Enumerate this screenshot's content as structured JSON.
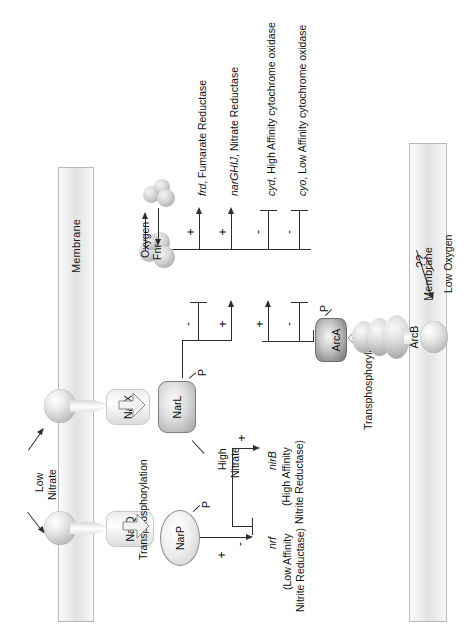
{
  "diagram": {
    "membrane_left_label": "Membrane",
    "membrane_right_label": "Membrane"
  },
  "left_system": {
    "stimulus_label": "Low\nNitrate",
    "stimulus_line1": "Low",
    "stimulus_line2": "Nitrate",
    "sensors": [
      {
        "name": "NarX"
      },
      {
        "name": "NarQ"
      }
    ],
    "transfer_label": "Transphosphorylation",
    "regulators": [
      {
        "name": "NarL",
        "phospho": "P",
        "shape": "rounded-rect"
      },
      {
        "name": "NarP",
        "phospho": "P",
        "shape": "ellipse"
      }
    ],
    "narl_condition": {
      "line1": "High",
      "line2": "Nitrate"
    },
    "narl_targets": [
      {
        "gene": "nirB",
        "sign": "+",
        "desc_line1": "(High Affinity",
        "desc_line2": "Nitrite Reductase)"
      },
      {
        "gene": "nrf",
        "sign": "-",
        "desc_line1": "(Low Affinity",
        "desc_line2": "Nitrite Reductase)"
      }
    ],
    "narp_targets": [
      {
        "gene": "nrf",
        "sign": "+",
        "desc_line1": "(Low Affinity",
        "desc_line2": "Nitrite Reductase)"
      }
    ]
  },
  "right_system": {
    "stimulus_label": "Low Oxygen",
    "uncertainty_label": "??",
    "sensor": {
      "name": "ArcB"
    },
    "transfer_label": "Transphosphorylation",
    "regulator": {
      "name": "ArcA",
      "phospho": "P",
      "shape": "cylinder"
    }
  },
  "oxygen_sensor": {
    "name": "Fnr",
    "stimulus_label": "Oxygen",
    "phospho": ""
  },
  "target_genes": [
    {
      "gene": "frd",
      "description": ", Fumarate Reductase"
    },
    {
      "gene": "narGHIJ",
      "description": ", Nitrate Reductase"
    },
    {
      "gene": "cyd",
      "description": ", High Affinity cytochrome oxidase"
    },
    {
      "gene": "cyo",
      "description": ", Low Affinity cytochrome oxidase"
    }
  ],
  "regulation": {
    "narl_row": [
      {
        "target": "frd",
        "sign": "-"
      },
      {
        "target": "narGHIJ",
        "sign": "+"
      }
    ],
    "arca_row": [
      {
        "target": "frd",
        "sign": "-"
      },
      {
        "target": "narGHIJ",
        "sign": "+"
      },
      {
        "target": "cyd",
        "sign": "+"
      },
      {
        "target": "cyo",
        "sign": "-"
      }
    ],
    "fnr_row": [
      {
        "target": "frd",
        "sign": "+"
      },
      {
        "target": "narGHIJ",
        "sign": "+"
      },
      {
        "target": "cyd",
        "sign": "-"
      },
      {
        "target": "cyo",
        "sign": "-"
      }
    ]
  },
  "colors": {
    "line": "#2e2e2e",
    "membrane_border": "#b9b9b9",
    "text": "#111111"
  }
}
